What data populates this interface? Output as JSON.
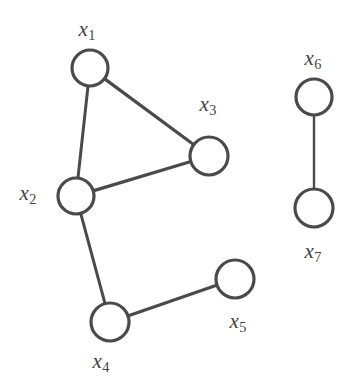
{
  "figure": {
    "width": 359,
    "height": 386,
    "background_color": "#ffffff",
    "stroke_color": "#4a4a4a",
    "node_fill_color": "#ffffff",
    "label_color": "#434343"
  },
  "chart_data": {
    "type": "diagram",
    "subtype": "node-link-graph",
    "title": "",
    "directed": false,
    "weighted": false,
    "nodes": [
      {
        "id": "x1",
        "base": "x",
        "subscript": "1",
        "label": "x1",
        "cx": 90,
        "cy": 68,
        "r": 18,
        "label_x": 87,
        "label_y": 31,
        "label_position": "above"
      },
      {
        "id": "x2",
        "base": "x",
        "subscript": "2",
        "label": "x2",
        "cx": 76,
        "cy": 196,
        "r": 18,
        "label_x": 28,
        "label_y": 195,
        "label_position": "left"
      },
      {
        "id": "x3",
        "base": "x",
        "subscript": "3",
        "label": "x3",
        "cx": 209,
        "cy": 156,
        "r": 19,
        "label_x": 208,
        "label_y": 106,
        "label_position": "above"
      },
      {
        "id": "x4",
        "base": "x",
        "subscript": "4",
        "label": "x4",
        "cx": 110,
        "cy": 322,
        "r": 19,
        "label_x": 101,
        "label_y": 363,
        "label_position": "below"
      },
      {
        "id": "x5",
        "base": "x",
        "subscript": "5",
        "label": "x5",
        "cx": 235,
        "cy": 279,
        "r": 19,
        "label_x": 238,
        "label_y": 323,
        "label_position": "below-left"
      },
      {
        "id": "x6",
        "base": "x",
        "subscript": "6",
        "label": "x6",
        "cx": 314,
        "cy": 97,
        "r": 18,
        "label_x": 313,
        "label_y": 60,
        "label_position": "above"
      },
      {
        "id": "x7",
        "base": "x",
        "subscript": "7",
        "label": "x7",
        "cx": 314,
        "cy": 208,
        "r": 19,
        "label_x": 313,
        "label_y": 253,
        "label_position": "below"
      }
    ],
    "edges": [
      {
        "source": "x1",
        "target": "x2",
        "stroke_width": 3
      },
      {
        "source": "x1",
        "target": "x3",
        "stroke_width": 3.2
      },
      {
        "source": "x2",
        "target": "x3",
        "stroke_width": 3.2
      },
      {
        "source": "x2",
        "target": "x4",
        "stroke_width": 3
      },
      {
        "source": "x4",
        "target": "x5",
        "stroke_width": 3.2
      },
      {
        "source": "x6",
        "target": "x7",
        "stroke_width": 2.4
      }
    ],
    "components": [
      [
        "x1",
        "x2",
        "x3",
        "x4",
        "x5"
      ],
      [
        "x6",
        "x7"
      ]
    ],
    "node_count": 7,
    "edge_count": 6
  }
}
